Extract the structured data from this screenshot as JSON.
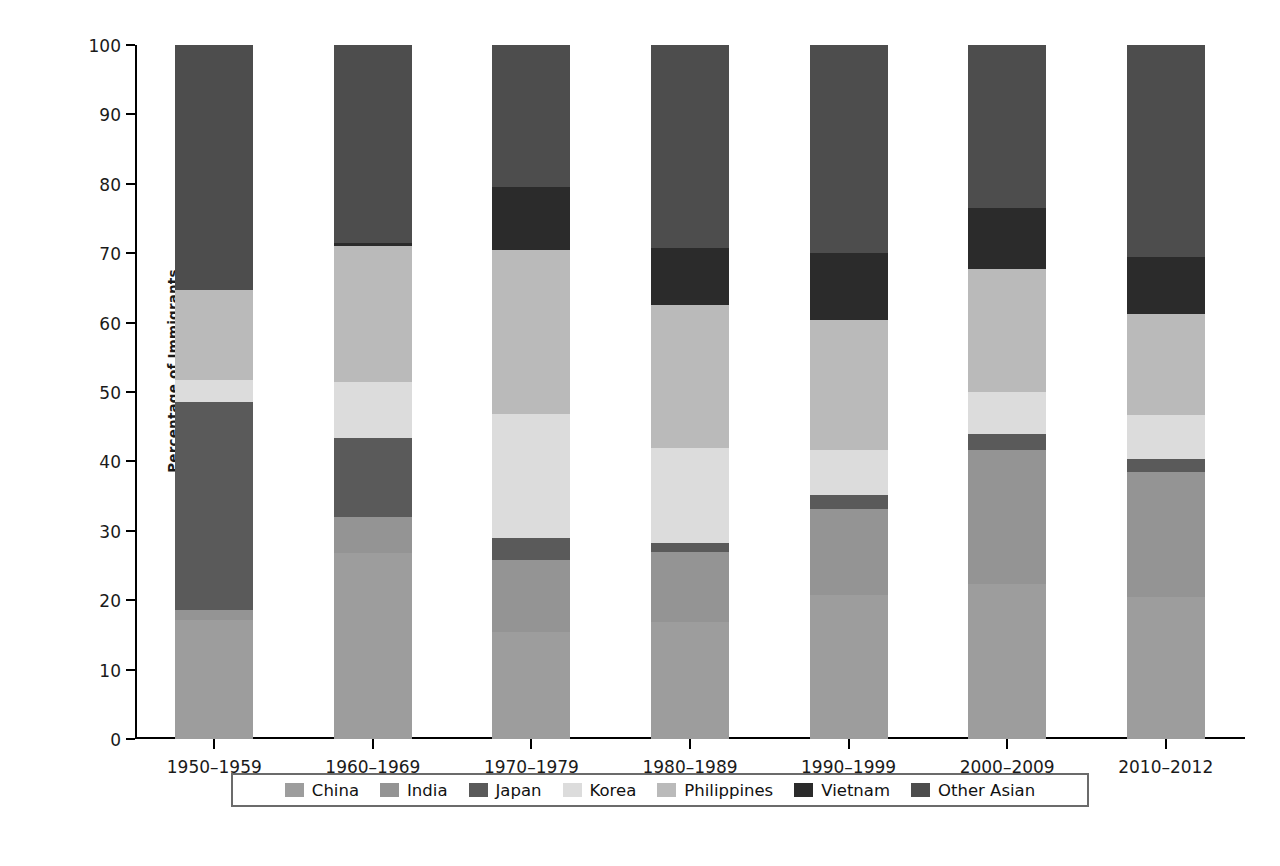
{
  "figure": {
    "y_axis_title": "Percentage of Immigrants",
    "y_ticks": [
      "0",
      "10",
      "20",
      "30",
      "40",
      "50",
      "60",
      "70",
      "80",
      "90",
      "100"
    ]
  },
  "chart_data": {
    "type": "bar",
    "stacked": true,
    "title": "",
    "xlabel": "",
    "ylabel": "Percentage of Immigrants",
    "ylim": [
      0,
      100
    ],
    "grid": false,
    "legend_position": "bottom",
    "categories": [
      "1950–1959",
      "1960–1969",
      "1970–1979",
      "1980–1989",
      "1990–1999",
      "2000–2009",
      "2010–2012"
    ],
    "series": [
      {
        "name": "China",
        "color": "#9d9d9d",
        "values": [
          17.2,
          26.8,
          15.4,
          16.9,
          20.7,
          22.4,
          20.4
        ]
      },
      {
        "name": "India",
        "color": "#949494",
        "values": [
          1.4,
          5.2,
          10.4,
          10.1,
          12.5,
          19.3,
          18.1
        ]
      },
      {
        "name": "Japan",
        "color": "#5a5a5a",
        "values": [
          29.9,
          11.4,
          3.2,
          1.3,
          1.9,
          2.3,
          1.9
        ]
      },
      {
        "name": "Korea",
        "color": "#dcdcdc",
        "values": [
          3.2,
          8.0,
          17.9,
          13.7,
          6.5,
          6.0,
          6.3
        ]
      },
      {
        "name": "Philippines",
        "color": "#bababa",
        "values": [
          13.0,
          19.6,
          23.6,
          20.6,
          18.8,
          17.7,
          14.5
        ]
      },
      {
        "name": "Vietnam",
        "color": "#2b2b2b",
        "values": [
          0.0,
          0.5,
          9.0,
          8.2,
          9.7,
          8.8,
          8.3
        ]
      },
      {
        "name": "Other Asian",
        "color": "#4d4d4d",
        "values": [
          35.3,
          28.5,
          20.5,
          29.2,
          29.9,
          23.5,
          30.5
        ]
      }
    ]
  },
  "legend": {
    "items": [
      {
        "label": "China",
        "color": "#9d9d9d"
      },
      {
        "label": "India",
        "color": "#949494"
      },
      {
        "label": "Japan",
        "color": "#5a5a5a"
      },
      {
        "label": "Korea",
        "color": "#dcdcdc"
      },
      {
        "label": "Philippines",
        "color": "#bababa"
      },
      {
        "label": "Vietnam",
        "color": "#2b2b2b"
      },
      {
        "label": "Other Asian",
        "color": "#4d4d4d"
      }
    ]
  }
}
